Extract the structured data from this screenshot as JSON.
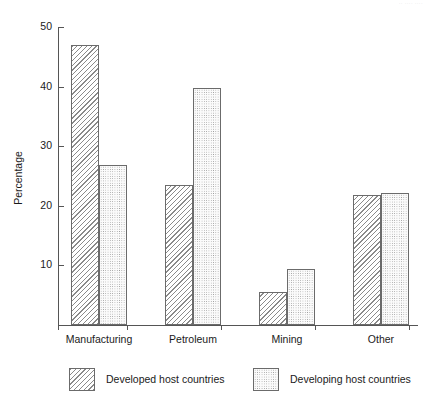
{
  "page": {
    "header_remnant": "·· ···· ····"
  },
  "chart_data": {
    "type": "bar",
    "title": "",
    "xlabel": "",
    "ylabel": "Percentage",
    "ylim": [
      0,
      50
    ],
    "yticks": [
      10,
      20,
      30,
      40,
      50
    ],
    "ytick_labels": [
      "10",
      "20",
      "30",
      "40",
      "50"
    ],
    "grid": false,
    "legend_position": "bottom",
    "categories": [
      "Manufacturing",
      "Petroleum",
      "Mining",
      "Other"
    ],
    "series": [
      {
        "name": "Developed host countries",
        "pattern": "diagonal-hatch",
        "values": [
          47.0,
          23.5,
          5.5,
          21.8
        ]
      },
      {
        "name": "Developing host countries",
        "pattern": "dotted",
        "values": [
          26.9,
          39.8,
          9.4,
          22.2
        ]
      }
    ]
  },
  "legend": {
    "items": [
      {
        "label": "Developed host countries",
        "pattern": "diagonal-hatch"
      },
      {
        "label": "Developing host countries",
        "pattern": "dotted"
      }
    ]
  }
}
